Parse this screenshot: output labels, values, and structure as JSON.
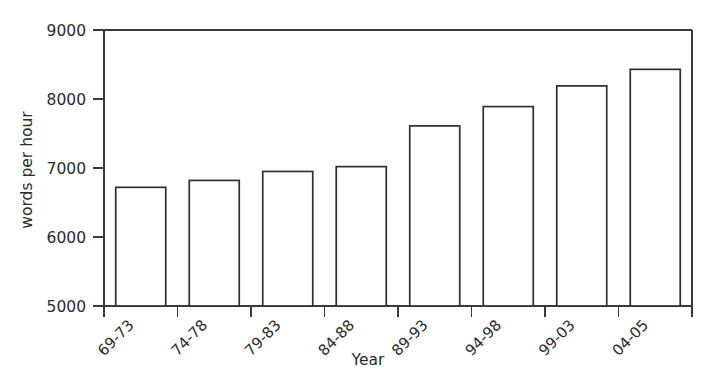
{
  "chart_data": {
    "type": "bar",
    "title": "",
    "xlabel": "Year",
    "ylabel": "words per hour",
    "categories": [
      "69-73",
      "74-78",
      "79-83",
      "84-88",
      "89-93",
      "94-98",
      "99-03",
      "04-05"
    ],
    "values": [
      6720,
      6820,
      6950,
      7020,
      7610,
      7890,
      8190,
      8430
    ],
    "ylim": [
      5000,
      9000
    ],
    "ytick_labels": [
      "5000",
      "6000",
      "7000",
      "8000",
      "9000"
    ],
    "ytick_values": [
      5000,
      6000,
      7000,
      8000,
      9000
    ],
    "grid": false,
    "legend": "none",
    "bar_fill_color": "#ffffff",
    "bar_edge_color": "#2f2f2f",
    "axis_color": "#3a3a3a",
    "text_color": "#2b2b2b",
    "background_color": "#ffffff",
    "xtick_label_rotation_degrees": 45
  }
}
